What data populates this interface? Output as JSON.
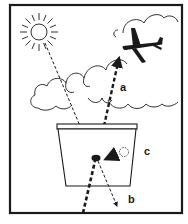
{
  "diagram": {
    "type": "physics-illustration",
    "labels": {
      "a": "a",
      "b": "b",
      "c": "c"
    },
    "elements": [
      {
        "id": "sun",
        "kind": "icon",
        "name": "sun"
      },
      {
        "id": "clouds",
        "kind": "shape",
        "name": "cloud-band"
      },
      {
        "id": "airplane",
        "kind": "icon",
        "name": "airplane"
      },
      {
        "id": "container",
        "kind": "shape",
        "name": "trapezoid-container"
      },
      {
        "id": "particle",
        "kind": "shape",
        "name": "dark-particle"
      },
      {
        "id": "ghost-particle",
        "kind": "shape",
        "name": "dotted-circle"
      },
      {
        "id": "ray-sun",
        "kind": "arrow",
        "style": "thin-dashed"
      },
      {
        "id": "ray-a",
        "kind": "arrow",
        "style": "thick-dashed",
        "label": "a"
      },
      {
        "id": "ray-b",
        "kind": "arrow",
        "style": "thin-dashed",
        "label": "b"
      },
      {
        "id": "ray-in",
        "kind": "arrow",
        "style": "thick-dashed"
      },
      {
        "id": "ray-c",
        "kind": "arrow",
        "style": "solid-short",
        "label": "c"
      }
    ],
    "colors": {
      "ink": "#1a1a1a",
      "background": "#ffffff"
    }
  }
}
